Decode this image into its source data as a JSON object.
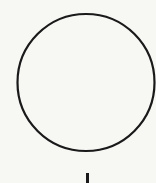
{
  "diagram": {
    "background": "#f7f7f4",
    "stroke_color": "#1a1a1a",
    "shapes": [
      {
        "type": "circle",
        "name": "circle-node",
        "cx": 86,
        "cy": 82.5,
        "r": 68.5,
        "stroke_width": 2.2,
        "fill": "none"
      },
      {
        "type": "line",
        "name": "connector-line",
        "x1": 87.5,
        "y1": 173,
        "x2": 87.5,
        "y2": 183,
        "stroke_width": 3
      }
    ]
  }
}
